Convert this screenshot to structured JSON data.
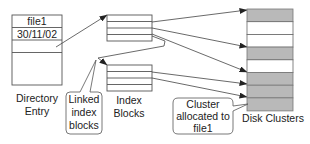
{
  "directory_entry": {
    "rows": [
      "file1",
      "30/11/02",
      "",
      ""
    ],
    "label_line1": "Directory",
    "label_line2": "Entry"
  },
  "index_blocks": {
    "label_line1": "Index",
    "label_line2": "Blocks",
    "blocks": [
      {
        "rows": 4
      },
      {
        "rows": 4
      }
    ]
  },
  "callouts": {
    "linked": {
      "line1": "Linked",
      "line2": "index",
      "line3": "blocks"
    },
    "cluster": {
      "line1": "Cluster",
      "line2": "allocated to",
      "line3": "file1"
    }
  },
  "disk_clusters": {
    "label": "Disk Clusters",
    "cells": [
      "allocated",
      "free",
      "free",
      "allocated",
      "free",
      "allocated",
      "allocated",
      "allocated"
    ],
    "colors": {
      "allocated": "#b9b9b9",
      "free": "#ffffff"
    }
  }
}
